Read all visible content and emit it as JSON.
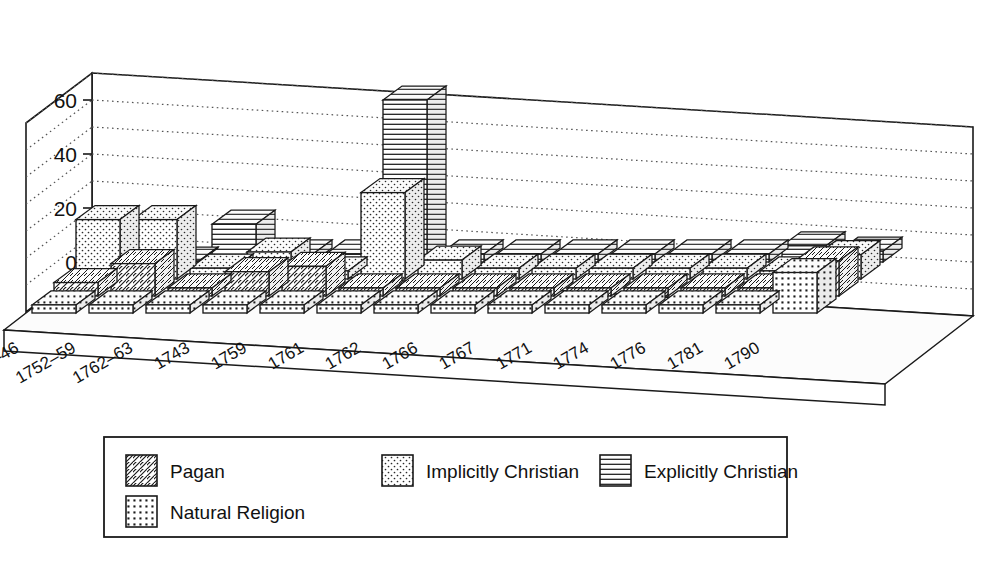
{
  "chart_data": {
    "type": "bar",
    "variant": "3d-grouped-bar",
    "title": "",
    "subtitle": "",
    "xlabel": "",
    "ylabel": "",
    "ylim": [
      0,
      70
    ],
    "yticks": [
      0,
      20,
      40,
      60
    ],
    "ytick_labels": [
      "0",
      "20",
      "40",
      "60"
    ],
    "gridline_interval": 10,
    "grid": true,
    "grid_style": "dotted",
    "legend_position": "bottom-left",
    "categories": [
      "1740–46",
      "1752–59",
      "1762–63",
      "1743",
      "1759",
      "1761",
      "1762",
      "1766",
      "1767",
      "1771",
      "1774",
      "1776",
      "1781",
      "1790"
    ],
    "series": [
      {
        "name": "Explicitly Christian",
        "pattern": "horizontal-lines",
        "depth_row": 0,
        "values": [
          0,
          0,
          14,
          3,
          3,
          60,
          3,
          3,
          3,
          3,
          3,
          3,
          6,
          4
        ]
      },
      {
        "name": "Implicitly Christian",
        "pattern": "sparse-dots",
        "depth_row": 1,
        "values": [
          22,
          22,
          4,
          10,
          3,
          32,
          7,
          4,
          4,
          4,
          4,
          4,
          3,
          9
        ]
      },
      {
        "name": "Pagan",
        "pattern": "diagonal-hatch",
        "depth_row": 2,
        "values": [
          5,
          12,
          3,
          9,
          11,
          3,
          3,
          3,
          3,
          3,
          3,
          3,
          3,
          13
        ]
      },
      {
        "name": "Natural Religion",
        "pattern": "square-dots",
        "depth_row": 3,
        "values": [
          3,
          3,
          3,
          3,
          3,
          3,
          3,
          3,
          3,
          3,
          3,
          3,
          3,
          15
        ]
      }
    ],
    "colors": {
      "line": "#1a1a1a",
      "fill": "#ffffff",
      "grid": "#555555",
      "floor": "#f2f2f2"
    }
  },
  "legend": {
    "items": [
      {
        "label": "Pagan",
        "pattern": "diagonal-hatch"
      },
      {
        "label": "Implicitly Christian",
        "pattern": "sparse-dots"
      },
      {
        "label": "Explicitly Christian",
        "pattern": "horizontal-lines"
      },
      {
        "label": "Natural Religion",
        "pattern": "square-dots"
      }
    ]
  }
}
